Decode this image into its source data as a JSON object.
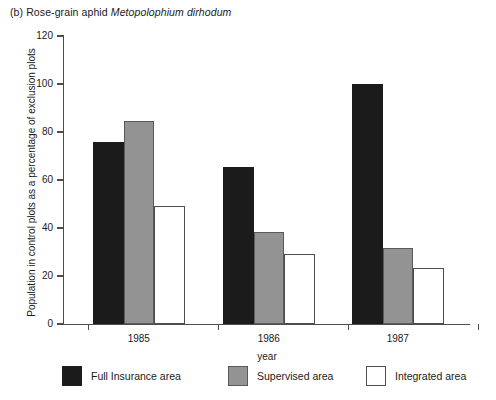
{
  "chart_data": {
    "type": "bar",
    "title": "(b) Rose-grain aphid Metopolophium dirhodum",
    "title_panel": "(b)",
    "title_common": "Rose-grain aphid",
    "title_species": "Metopolophium dirhodum",
    "xlabel": "year",
    "ylabel": "Population in control plots as a percentage of exclusion plots",
    "categories": [
      "1985",
      "1986",
      "1987"
    ],
    "ylim": [
      0,
      120
    ],
    "yticks": [
      0,
      20,
      40,
      60,
      80,
      100,
      120
    ],
    "ytick_labels": [
      "0",
      "20",
      "40",
      "60",
      "80",
      "100",
      "120"
    ],
    "grid": false,
    "legend_position": "bottom",
    "series": [
      {
        "name": "Full Insurance area",
        "color": "#1b1b1b",
        "values": [
          76,
          65.5,
          100
        ]
      },
      {
        "name": "Supervised area",
        "color": "#939393",
        "values": [
          84.5,
          38.5,
          31.5
        ]
      },
      {
        "name": "Integrated area",
        "color": "#ffffff",
        "values": [
          49,
          29,
          23.5
        ]
      }
    ]
  },
  "axis": {
    "tick_color": "#4d4d4d"
  }
}
